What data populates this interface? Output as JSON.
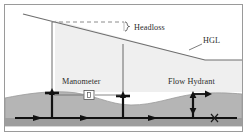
{
  "figure": {
    "frame": {
      "border_color": "#9a9a9a",
      "background": "#ffffff"
    },
    "colors": {
      "water_fill": "#efefef",
      "ground_fill": "#a8a8a8",
      "ground_fill_light": "#c3c3c3",
      "pipe_line": "#1a1a1a",
      "hgl_line": "#4f4f4f",
      "dashed_line": "#8c8c8c",
      "label_text": "#2c2c2c"
    },
    "labels": [
      {
        "id": "headloss",
        "text": "Headloss",
        "x": 131,
        "y": 28
      },
      {
        "id": "hgl",
        "text": "HGL",
        "x": 207,
        "y": 39
      },
      {
        "id": "manometer",
        "text": "Manometer",
        "x": 84,
        "y": 84
      },
      {
        "id": "flow_hydrant",
        "text": "Flow Hydrant",
        "x": 193,
        "y": 84
      }
    ],
    "elements": {
      "hgl_line_name": "hydraulic-grade-line",
      "dashed_datum_name": "headloss-datum-dashed-line",
      "headloss_brace_name": "headloss-brace",
      "hgl_leader_name": "hgl-leader-line",
      "manometer_left_name": "manometer-riser-left",
      "manometer_right_name": "manometer-riser-right",
      "manometer_gauge_name": "manometer-gauge-box",
      "manometer_connector_name": "manometer-connector-line",
      "hydrant_name": "flow-hydrant-riser",
      "hydrant_discharge_arrow_name": "hydrant-discharge-arrow",
      "pipe_name": "water-main-pipe",
      "valve_marker_name": "closed-valve-x-marker",
      "ground_name": "ground-surface",
      "water_region_name": "water-pressure-region"
    },
    "flow_arrows": [
      {
        "id": "flow-arrow-1",
        "x": 33,
        "y": 118
      },
      {
        "id": "flow-arrow-2",
        "x": 80,
        "y": 118
      },
      {
        "id": "flow-arrow-3",
        "x": 148,
        "y": 118
      }
    ],
    "risers": [
      {
        "id": "manometer-riser-left",
        "x": 47
      },
      {
        "id": "manometer-riser-right",
        "x": 118
      },
      {
        "id": "flow-hydrant-riser",
        "x": 188
      }
    ]
  }
}
